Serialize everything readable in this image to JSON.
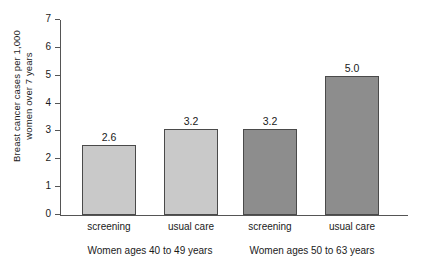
{
  "chart_data": {
    "type": "bar",
    "title": "",
    "xlabel": "",
    "ylabel": "Breast cancer cases per 1,000 women over 7 years",
    "ylabel_lines": [
      "Breast cancer cases per 1,000",
      "women over 7 years"
    ],
    "ylim": [
      0,
      7
    ],
    "ytick_labels": [
      "0",
      "1",
      "2",
      "3",
      "4",
      "5",
      "6",
      "7"
    ],
    "ytick_values": [
      0,
      1,
      2,
      3,
      4,
      5,
      6,
      7
    ],
    "grid": false,
    "legend": "none",
    "categories": [
      "screening",
      "usual care",
      "screening",
      "usual care"
    ],
    "values": [
      2.6,
      3.2,
      3.2,
      5.0
    ],
    "bar_drawn_heights": [
      2.5,
      3.1,
      3.1,
      5.0
    ],
    "value_labels": [
      "2.6",
      "3.2",
      "3.2",
      "5.0"
    ],
    "bar_colors": [
      "#c9c9c9",
      "#c9c9c9",
      "#8d8d8d",
      "#8d8d8d"
    ],
    "bar_edge_color": "#4a4a4a",
    "groups": [
      {
        "label": "Women ages 40 to 49 years",
        "bars": [
          0,
          1
        ]
      },
      {
        "label": "Women ages 50 to 63 years",
        "bars": [
          2,
          3
        ]
      }
    ]
  },
  "bars": [
    {
      "category": "screening",
      "value_label": "2.6",
      "value": 2.6,
      "drawn": 2.5,
      "color": "#c9c9c9",
      "left": 22,
      "width": 54
    },
    {
      "category": "usual care",
      "value_label": "3.2",
      "value": 3.2,
      "drawn": 3.1,
      "color": "#c9c9c9",
      "left": 104,
      "width": 54
    },
    {
      "category": "screening",
      "value_label": "3.2",
      "value": 3.2,
      "drawn": 3.1,
      "color": "#8d8d8d",
      "left": 183,
      "width": 54
    },
    {
      "category": "usual care",
      "value_label": "5.0",
      "value": 5.0,
      "drawn": 5.0,
      "color": "#8d8d8d",
      "left": 265,
      "width": 54
    }
  ],
  "axis": {
    "y_title_line1": "Breast cancer cases per 1,000",
    "y_title_line2": "women over 7 years"
  },
  "groups": [
    {
      "label": "Women ages 40 to 49 years",
      "center": 90
    },
    {
      "label": "Women ages 50 to 63 years",
      "center": 252
    }
  ]
}
